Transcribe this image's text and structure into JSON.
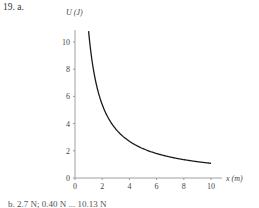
{
  "problem": {
    "label": "19. a."
  },
  "chart_data": {
    "type": "line",
    "title": "",
    "xlabel": "x (m)",
    "ylabel": "U (J)",
    "xlim": [
      0,
      11
    ],
    "ylim": [
      0,
      11
    ],
    "xticks": [
      0,
      2,
      4,
      6,
      8,
      10
    ],
    "yticks": [
      0,
      2,
      4,
      6,
      8,
      10
    ],
    "grid": false,
    "series": [
      {
        "name": "U(x)",
        "x": [
          1.0,
          1.25,
          1.5,
          1.75,
          2.0,
          2.5,
          3.0,
          3.5,
          4.0,
          5.0,
          6.0,
          7.0,
          8.0,
          9.0,
          10.0
        ],
        "values": [
          10.8,
          8.7,
          7.2,
          6.2,
          5.4,
          4.3,
          3.6,
          3.1,
          2.7,
          2.2,
          1.8,
          1.55,
          1.35,
          1.2,
          1.08
        ]
      }
    ],
    "color": "#1a1a1a"
  },
  "axes": {
    "y_label": "U (J)",
    "x_label": "x (m)",
    "y_ticks": [
      "0",
      "2",
      "4",
      "6",
      "8",
      "10"
    ],
    "x_ticks": [
      "0",
      "2",
      "4",
      "6",
      "8",
      "10"
    ]
  },
  "footer": {
    "partial_text": "b. 2.7 N; 0.40 N ... 10.13 N"
  }
}
